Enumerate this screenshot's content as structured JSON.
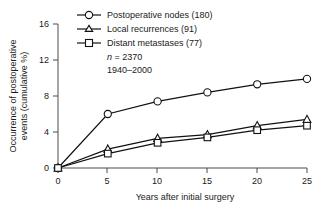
{
  "chart_data": {
    "type": "line",
    "title": "",
    "xlabel": "Years after initial surgery",
    "ylabel": "Occurrence of postoperative events (cumulative %)",
    "ylabel_line1": "Occurrence of postoperative",
    "ylabel_line2": "events (cumulative %)",
    "x": [
      0,
      5,
      10,
      15,
      20,
      25
    ],
    "xlim": [
      0,
      25
    ],
    "ylim": [
      0,
      16
    ],
    "xticks": [
      "0",
      "5",
      "10",
      "15",
      "20",
      "25"
    ],
    "yticks": [
      "0",
      "4",
      "8",
      "12",
      "16"
    ],
    "grid": false,
    "legend_position": "top-center",
    "series": [
      {
        "name": "Postoperative nodes (180)",
        "marker": "circle",
        "values": [
          0,
          6.0,
          7.4,
          8.4,
          9.3,
          9.9
        ]
      },
      {
        "name": "Local recurrences (91)",
        "marker": "triangle",
        "values": [
          0,
          2.1,
          3.3,
          3.7,
          4.7,
          5.4
        ]
      },
      {
        "name": "Distant metastases (77)",
        "marker": "square",
        "values": [
          0,
          1.6,
          2.8,
          3.4,
          4.2,
          4.7
        ]
      }
    ],
    "annotations": [
      {
        "text": "n = 2370",
        "italic_prefix": "n",
        "rest": " = 2370"
      },
      {
        "text": "1940–2000"
      }
    ],
    "colors": {
      "line": "#111111",
      "marker_fill": "#ffffff",
      "axis": "#4d4d4d",
      "text": "#1a1a1a",
      "background": "#ffffff"
    }
  }
}
